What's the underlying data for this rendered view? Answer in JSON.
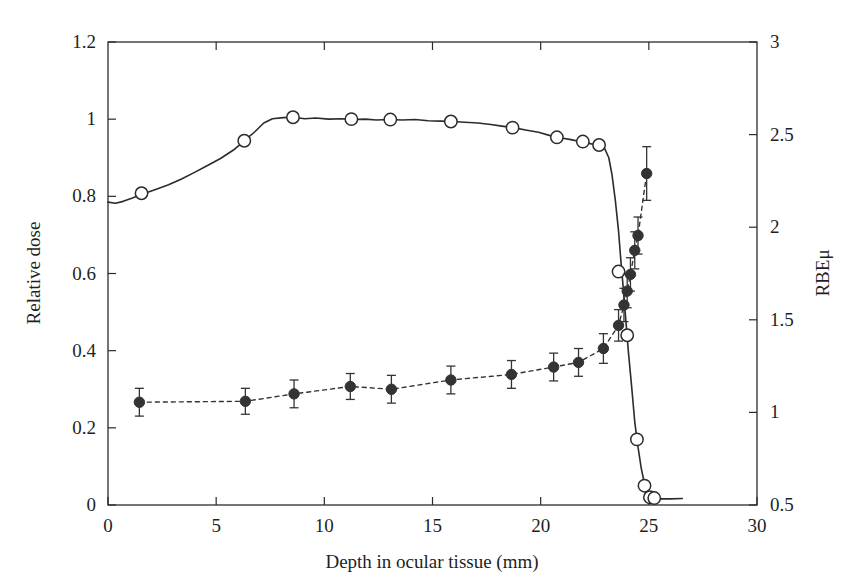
{
  "chart_data": {
    "type": "line",
    "title": "",
    "xlabel": "Depth in ocular tissue (mm)",
    "ylabel": "Relative dose",
    "y2label": "RBEμ",
    "xlim": [
      0,
      30
    ],
    "ylim": [
      0,
      1.2
    ],
    "y2lim": [
      0.5,
      3
    ],
    "xticks": [
      0,
      5,
      10,
      15,
      20,
      25,
      30
    ],
    "xticklabels": [
      "0",
      "5",
      "10",
      "15",
      "20",
      "25",
      "30"
    ],
    "yticks": [
      0,
      0.2,
      0.4,
      0.6,
      0.8,
      1,
      1.2
    ],
    "yticklabels": [
      "0",
      "0.2",
      "0.4",
      "0.6",
      "0.8",
      "1",
      "1.2"
    ],
    "y2ticks": [
      0.5,
      1,
      1.5,
      2,
      2.5,
      3
    ],
    "y2ticklabels": [
      "0.5",
      "1",
      "1.5",
      "2",
      "2.5",
      "3"
    ],
    "grid": false,
    "legend": "none",
    "frame": "box",
    "series": [
      {
        "name": "Relative dose (depth-dose curve)",
        "axis": "left",
        "marker": "open-circle",
        "linestyle": "solid",
        "color": "#2b2b2b",
        "curve": [
          [
            0.0,
            0.785
          ],
          [
            0.35,
            0.782
          ],
          [
            0.7,
            0.787
          ],
          [
            1.1,
            0.795
          ],
          [
            1.6,
            0.806
          ],
          [
            2.2,
            0.818
          ],
          [
            2.8,
            0.83
          ],
          [
            3.4,
            0.845
          ],
          [
            4.0,
            0.862
          ],
          [
            4.6,
            0.88
          ],
          [
            5.2,
            0.898
          ],
          [
            5.8,
            0.92
          ],
          [
            6.3,
            0.944
          ],
          [
            6.8,
            0.968
          ],
          [
            7.2,
            0.99
          ],
          [
            7.6,
            1.001
          ],
          [
            8.1,
            1.004
          ],
          [
            8.55,
            1.005
          ],
          [
            9.1,
            1.001
          ],
          [
            9.6,
            1.003
          ],
          [
            10.2,
            1.0
          ],
          [
            10.8,
            1.001
          ],
          [
            11.3,
            0.999
          ],
          [
            11.9,
            1.0
          ],
          [
            12.4,
            0.998
          ],
          [
            13.0,
            0.999
          ],
          [
            13.6,
            0.998
          ],
          [
            14.2,
            0.999
          ],
          [
            14.8,
            0.996
          ],
          [
            15.4,
            0.995
          ],
          [
            15.9,
            0.994
          ],
          [
            16.5,
            0.992
          ],
          [
            17.1,
            0.99
          ],
          [
            17.7,
            0.986
          ],
          [
            18.2,
            0.982
          ],
          [
            18.75,
            0.978
          ],
          [
            19.3,
            0.972
          ],
          [
            19.9,
            0.966
          ],
          [
            20.4,
            0.958
          ],
          [
            20.9,
            0.952
          ],
          [
            21.4,
            0.947
          ],
          [
            21.9,
            0.941
          ],
          [
            22.35,
            0.936
          ],
          [
            22.7,
            0.933
          ],
          [
            22.95,
            0.925
          ],
          [
            23.15,
            0.9
          ],
          [
            23.3,
            0.855
          ],
          [
            23.45,
            0.79
          ],
          [
            23.6,
            0.71
          ],
          [
            23.72,
            0.625
          ],
          [
            23.82,
            0.56
          ],
          [
            23.95,
            0.47
          ],
          [
            24.05,
            0.4
          ],
          [
            24.2,
            0.31
          ],
          [
            24.35,
            0.215
          ],
          [
            24.5,
            0.15
          ],
          [
            24.65,
            0.095
          ],
          [
            24.8,
            0.055
          ],
          [
            24.95,
            0.03
          ],
          [
            25.1,
            0.02
          ],
          [
            25.4,
            0.016
          ],
          [
            26.0,
            0.016
          ],
          [
            26.55,
            0.017
          ]
        ],
        "markers": [
          [
            1.55,
            0.808
          ],
          [
            6.3,
            0.944
          ],
          [
            8.55,
            1.005
          ],
          [
            11.25,
            1.0
          ],
          [
            13.05,
            0.999
          ],
          [
            15.85,
            0.994
          ],
          [
            18.7,
            0.978
          ],
          [
            20.75,
            0.953
          ],
          [
            21.95,
            0.942
          ],
          [
            22.7,
            0.933
          ],
          [
            23.6,
            0.605
          ],
          [
            24.0,
            0.44
          ],
          [
            24.45,
            0.17
          ],
          [
            24.8,
            0.05
          ],
          [
            25.05,
            0.02
          ],
          [
            25.25,
            0.018
          ]
        ]
      },
      {
        "name": "RBEμ measurements",
        "axis": "right",
        "marker": "filled-circle",
        "linestyle": "dashed",
        "color": "#333333",
        "points": [
          {
            "x": 1.45,
            "y": 1.055,
            "err": 0.075
          },
          {
            "x": 6.35,
            "y": 1.06,
            "err": 0.07
          },
          {
            "x": 8.6,
            "y": 1.1,
            "err": 0.075
          },
          {
            "x": 11.2,
            "y": 1.14,
            "err": 0.07
          },
          {
            "x": 13.1,
            "y": 1.125,
            "err": 0.075
          },
          {
            "x": 15.85,
            "y": 1.175,
            "err": 0.075
          },
          {
            "x": 18.65,
            "y": 1.205,
            "err": 0.075
          },
          {
            "x": 20.6,
            "y": 1.245,
            "err": 0.075
          },
          {
            "x": 21.75,
            "y": 1.27,
            "err": 0.075
          },
          {
            "x": 22.9,
            "y": 1.345,
            "err": 0.08
          },
          {
            "x": 23.6,
            "y": 1.47,
            "err": 0.085
          },
          {
            "x": 23.85,
            "y": 1.58,
            "err": 0.09
          },
          {
            "x": 24.0,
            "y": 1.655,
            "err": 0.09
          },
          {
            "x": 24.15,
            "y": 1.745,
            "err": 0.09
          },
          {
            "x": 24.35,
            "y": 1.875,
            "err": 0.1
          },
          {
            "x": 24.5,
            "y": 1.955,
            "err": 0.1
          },
          {
            "x": 24.9,
            "y": 2.29,
            "err": 0.145
          }
        ]
      }
    ]
  }
}
